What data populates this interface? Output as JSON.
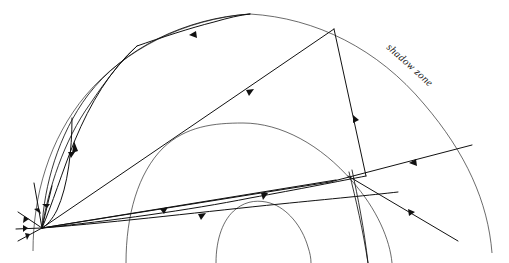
{
  "figure": {
    "type": "ray-path-diagram",
    "background_color": "#ffffff",
    "line_color": "#111111",
    "boundary_color": "#2b2b2b",
    "labels": [
      {
        "id": "shadow-zone",
        "text": "shadow zone",
        "x": 385,
        "y": 45,
        "rotation_deg": 42,
        "style": "italic-serif"
      }
    ],
    "source": {
      "label": "",
      "x": 42,
      "y": 228
    },
    "boundaries": [
      {
        "name": "outer-surface",
        "role": "earth-surface",
        "path": "M 33 250 C 33 160, 105 42, 250 14 C 368 24, 460 110, 492 252"
      },
      {
        "name": "mantle-core-boundary",
        "role": "core-mantle-boundary",
        "path": "M 126 263 C 126 175, 175 124, 240 123 C 320 123, 384 170, 392 263"
      },
      {
        "name": "inner-core-boundary",
        "role": "inner-core-boundary",
        "path": "M 216 263 C 216 222, 240 202, 263 202 C 288 202, 311 222, 311 263"
      }
    ],
    "rays": [
      {
        "name": "ray-surface-arc-left",
        "kind": "reflected-up-left"
      },
      {
        "name": "ray-to-apex",
        "kind": "direct-surface-apex"
      },
      {
        "name": "ray-apex-return",
        "kind": "refracted-return"
      },
      {
        "name": "ray-to-upper-right-surface",
        "kind": "direct"
      },
      {
        "name": "ray-core-refracted-upper",
        "kind": "core-refracted"
      },
      {
        "name": "ray-core-refracted-lower",
        "kind": "core-refracted"
      },
      {
        "name": "ray-grazing-boundary",
        "kind": "grazing"
      },
      {
        "name": "ray-shallow-left",
        "kind": "shallow-turning"
      },
      {
        "name": "ray-steep-down-right",
        "kind": "transmitted-down"
      }
    ]
  }
}
